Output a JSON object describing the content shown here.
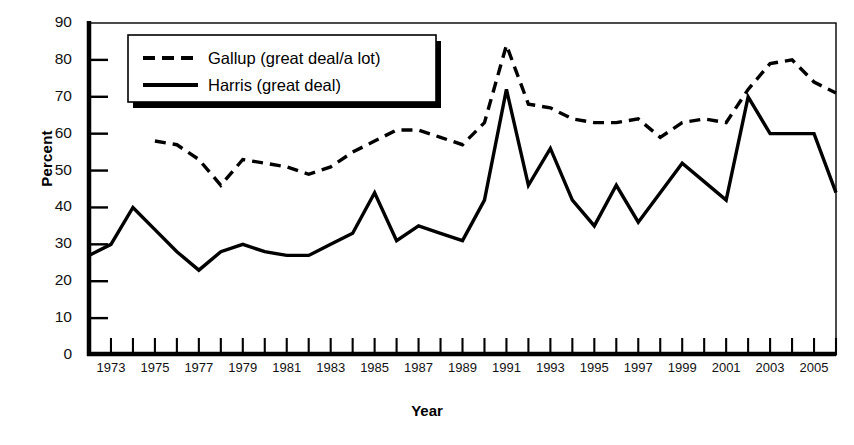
{
  "chart_data": {
    "type": "line",
    "title": "",
    "xlabel": "Year",
    "ylabel": "Percent",
    "ylim": [
      0,
      90
    ],
    "xlim": [
      1972,
      2006
    ],
    "ytick_step": 10,
    "yticks": [
      0,
      10,
      20,
      30,
      40,
      50,
      60,
      70,
      80,
      90
    ],
    "xticks_labeled": [
      1973,
      1975,
      1977,
      1979,
      1981,
      1983,
      1985,
      1987,
      1989,
      1991,
      1993,
      1995,
      1997,
      1999,
      2001,
      2003,
      2005
    ],
    "xtick_minor_every": 1,
    "grid": false,
    "legend_position": "top-left",
    "series": [
      {
        "name": "Gallup (great deal/a lot)",
        "style": "dashed",
        "color": "#000000",
        "x": [
          1975,
          1976,
          1977,
          1978,
          1979,
          1980,
          1981,
          1982,
          1983,
          1984,
          1985,
          1986,
          1987,
          1988,
          1989,
          1990,
          1991,
          1992,
          1993,
          1994,
          1995,
          1996,
          1997,
          1998,
          1999,
          2000,
          2001,
          2002,
          2003,
          2004,
          2005,
          2006
        ],
        "values": [
          58,
          57,
          53,
          46,
          53,
          52,
          51,
          49,
          51,
          55,
          58,
          61,
          61,
          59,
          57,
          63,
          84,
          68,
          67,
          64,
          63,
          63,
          64,
          59,
          63,
          64,
          63,
          72,
          79,
          80,
          74,
          71
        ]
      },
      {
        "name": "Harris (great deal)",
        "style": "solid",
        "color": "#000000",
        "x": [
          1972,
          1973,
          1974,
          1975,
          1976,
          1977,
          1978,
          1979,
          1980,
          1981,
          1982,
          1983,
          1984,
          1985,
          1986,
          1987,
          1988,
          1989,
          1990,
          1991,
          1992,
          1993,
          1994,
          1995,
          1996,
          1997,
          1998,
          1999,
          2000,
          2001,
          2002,
          2003,
          2004,
          2005,
          2006
        ],
        "values": [
          27,
          30,
          40,
          34,
          28,
          23,
          28,
          30,
          28,
          27,
          27,
          30,
          33,
          44,
          31,
          35,
          33,
          31,
          42,
          72,
          46,
          56,
          42,
          35,
          46,
          36,
          44,
          52,
          47,
          42,
          70,
          60,
          60,
          60,
          44
        ]
      }
    ]
  },
  "legend": {
    "entries": [
      {
        "label": "Gallup (great deal/a lot)",
        "style": "dashed"
      },
      {
        "label": "Harris (great deal)",
        "style": "solid"
      }
    ]
  },
  "axis": {
    "y_title": "Percent",
    "x_title": "Year"
  }
}
